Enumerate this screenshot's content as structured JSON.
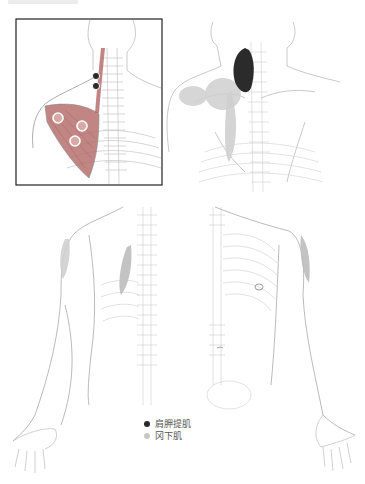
{
  "figure": {
    "caption_visible": false,
    "panels": [
      {
        "id": "inset-trigger-points",
        "description": "Posterior neck and shoulder with levator scapulae and subscapularis trigger points",
        "framed": true
      },
      {
        "id": "back-referred-pain",
        "description": "Posterior upper back showing referred pain zones"
      },
      {
        "id": "posterior-arm",
        "description": "Posterior view of arm and spine with pain area on shoulder"
      },
      {
        "id": "anterior-arm",
        "description": "Anterior view of ribcage and arm with pain area on shoulder"
      }
    ]
  },
  "legend": {
    "items": [
      {
        "label": "肩胛提肌",
        "color": "#2b2b2b"
      },
      {
        "label": "冈下肌",
        "color": "#c8c8c8"
      }
    ]
  },
  "colors": {
    "line": "#bdbdbd",
    "dark_zone": "#2b2b2b",
    "light_zone": "#cfcfcf",
    "muscle_red": "#b7706e"
  }
}
